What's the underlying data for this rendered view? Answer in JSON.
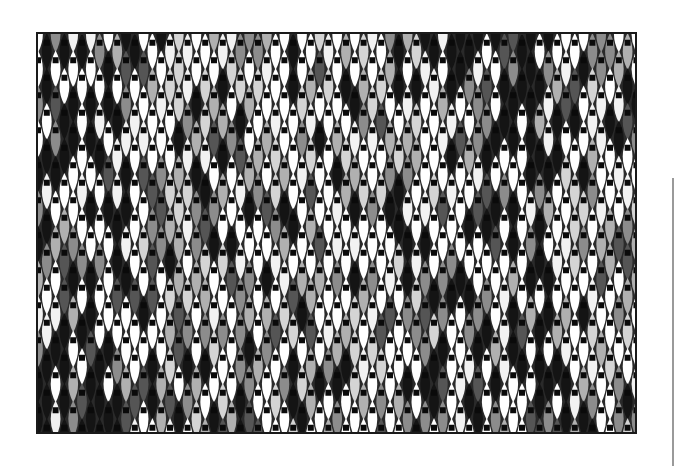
{
  "artwork": {
    "type": "woven-textile-pattern",
    "motif": "spindle-ovals-with-square-nodes",
    "columns": 34,
    "rows": 23,
    "col_spacing": 17.6,
    "row_spacing": 17.5,
    "palette": [
      "#ffffff",
      "#f2f2f2",
      "#d4d4d4",
      "#b0b0b0",
      "#8c8c8c",
      "#555555",
      "#141414"
    ],
    "node_color": "#0a0a0a",
    "border_color": "#1a1a1a"
  },
  "scale_line": {
    "color": "#9a9a9a"
  }
}
